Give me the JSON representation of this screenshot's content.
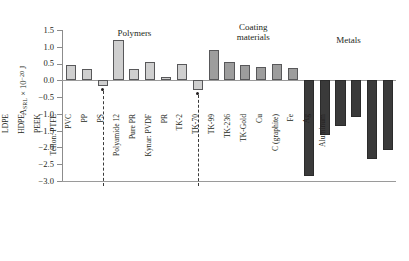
{
  "chart_data": {
    "type": "bar",
    "title": "",
    "xlabel": "",
    "ylabel": "A_SRL × 10⁻²⁰ J",
    "ylabel_parts": {
      "symbol": "A",
      "subscript": "SRL",
      "multiplier": " × 10",
      "exponent": "−20",
      "unit": " J"
    },
    "ylim": [
      -3.0,
      1.5
    ],
    "ytick_labels": [
      "1.5",
      "1.0",
      "0.5",
      "0.0",
      "−0.5",
      "−1.0",
      "−1.5",
      "−2.0",
      "−2.5",
      "−3.0"
    ],
    "ytick_values": [
      1.5,
      1.0,
      0.5,
      0.0,
      -0.5,
      -1.0,
      -1.5,
      -2.0,
      -2.5,
      -3.0
    ],
    "grid": false,
    "legend": "none",
    "categories": [
      "LDPE",
      "HDPE",
      "PEEK",
      "Teflon: PTFE",
      "PVC",
      "PP",
      "PS",
      "Polyamide 12",
      "Pure PR",
      "Kynar: PVDF",
      "PR",
      "TK-2",
      "TK-70",
      "TK-99",
      "TK-236",
      "TK-Gold",
      "Cu",
      "C (graphite)",
      "Fe",
      "Ag",
      "Aluminum"
    ],
    "values": [
      0.45,
      0.33,
      -0.18,
      1.2,
      0.33,
      0.55,
      0.11,
      0.49,
      -0.28,
      0.9,
      0.55,
      0.47,
      0.4,
      0.49,
      0.38,
      -2.85,
      -1.62,
      -1.35,
      -1.1,
      -2.35,
      -2.08
    ],
    "group_of_bar": [
      "polymer",
      "polymer",
      "polymer",
      "polymer",
      "polymer",
      "polymer",
      "polymer",
      "polymer",
      "polymer",
      "coating",
      "coating",
      "coating",
      "coating",
      "coating",
      "coating",
      "metal",
      "metal",
      "metal",
      "metal",
      "metal",
      "metal"
    ],
    "groups": [
      {
        "name": "Polymers",
        "label": "Polymers",
        "first_index": 0,
        "last_index": 8
      },
      {
        "name": "Coating materials",
        "label": "Coating\nmaterials",
        "first_index": 9,
        "last_index": 14
      },
      {
        "name": "Metals",
        "label": "Metals",
        "first_index": 15,
        "last_index": 20
      }
    ],
    "annotations": [
      {
        "category": "PEEK",
        "value": -0.18,
        "marker": "dashed-leader-to-label"
      },
      {
        "category": "Pure PR",
        "value": -0.28,
        "marker": "dashed-leader-to-label"
      }
    ],
    "colors": {
      "polymer_fill": "#cfcfcf",
      "coating_fill": "#9d9d9d",
      "metal_fill": "#3a3a3a",
      "bar_edge": "#58585a",
      "axis": "#8c8c8c",
      "text": "#231f20",
      "background": "#ffffff"
    }
  }
}
